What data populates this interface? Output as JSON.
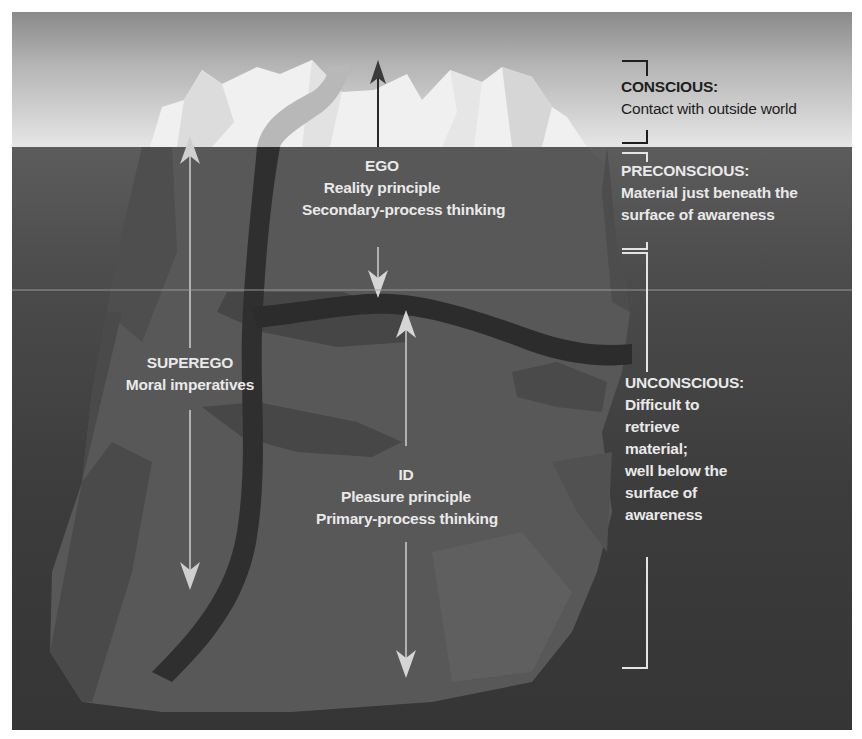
{
  "diagram": {
    "type": "iceberg-model-of-mind",
    "colors": {
      "sky_top": "#8a8a8a",
      "sky_bottom": "#e6e6e6",
      "water": "#3c3c3c",
      "ice_above": "#f2f2f2",
      "ice_below": "#555555",
      "ego_band": "#2e2e2e",
      "label_light": "#e9e9e9",
      "label_dark": "#1e1e1e"
    },
    "structures": {
      "ego": {
        "title": "EGO",
        "lines": [
          "Reality principle",
          "Secondary-process thinking"
        ]
      },
      "superego": {
        "title": "SUPEREGO",
        "lines": [
          "Moral imperatives"
        ]
      },
      "id": {
        "title": "ID",
        "lines": [
          "Pleasure principle",
          "Primary-process thinking"
        ]
      }
    },
    "levels": {
      "conscious": {
        "title": "CONSCIOUS:",
        "lines": [
          "Contact with outside world"
        ]
      },
      "preconscious": {
        "title": "PRECONSCIOUS:",
        "lines": [
          "Material just beneath the",
          "surface of awareness"
        ]
      },
      "unconscious": {
        "title": "UNCONSCIOUS:",
        "lines": [
          "Difficult to",
          "retrieve",
          "material;",
          "well below the",
          "surface of",
          "awareness"
        ]
      }
    },
    "arrows": [
      {
        "name": "ego-arrow",
        "direction": "both",
        "from": "above-surface",
        "to": "ego-band"
      },
      {
        "name": "superego-arrow",
        "direction": "both",
        "from": "surface",
        "to": "deep"
      },
      {
        "name": "id-arrow",
        "direction": "both",
        "from": "ego-band",
        "to": "bottom"
      }
    ]
  }
}
